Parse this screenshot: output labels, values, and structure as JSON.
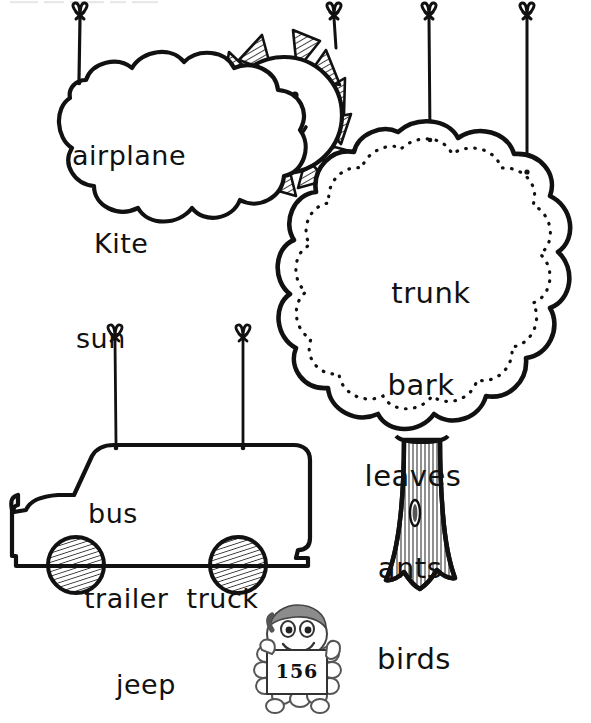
{
  "page": {
    "page_number": "156",
    "background_color": "#ffffff",
    "ink_color": "#111111",
    "top_cut_text": ""
  },
  "shapes": {
    "cloud": {
      "name": "cloud",
      "words": [
        "airplane",
        "Kite",
        "sun"
      ],
      "hanger_count": 1
    },
    "sun": {
      "name": "sun",
      "face": "smiling",
      "ray_count": 11,
      "hanger_count": 1
    },
    "tree": {
      "name": "tree",
      "words": [
        "trunk",
        "bark",
        "leaves",
        "ants",
        "birds"
      ],
      "hanger_count": 2
    },
    "bus": {
      "name": "bus",
      "word_rows": [
        "bus",
        "trailer  truck",
        "jeep"
      ],
      "words": [
        "bus",
        "trailer",
        "truck",
        "jeep"
      ],
      "hanger_count": 2,
      "wheel_count": 2
    }
  },
  "badge": {
    "character": "cartoon-mascot-holding-sign",
    "number": "156"
  }
}
